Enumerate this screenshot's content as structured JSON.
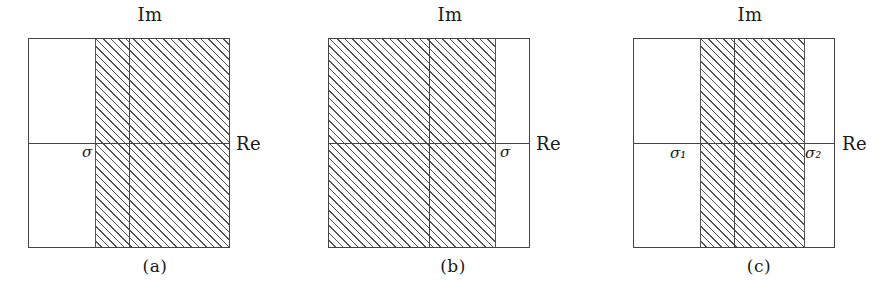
{
  "figure": {
    "kind": "complex-plane-region-of-convergence-diagrams",
    "panels": [
      {
        "id": "a",
        "caption": "(a)",
        "imaginary_axis_label": "Im",
        "real_axis_label": "Re",
        "abscissa_labels": [
          "σ"
        ],
        "shaded_description": "right half plane Re{s} > sigma",
        "hatch_regions": [
          {
            "left_pct": 33,
            "right_pct": 100
          }
        ],
        "vertical_rules_pct": [
          33,
          50
        ],
        "horizontal_rule_pct": 50,
        "sigma_marks": [
          {
            "label": "σ",
            "subscript": "",
            "x_pct": 33,
            "side": "left"
          }
        ]
      },
      {
        "id": "b",
        "caption": "(b)",
        "imaginary_axis_label": "Im",
        "real_axis_label": "Re",
        "abscissa_labels": [
          "σ"
        ],
        "shaded_description": "left half plane Re{s} < sigma",
        "hatch_regions": [
          {
            "left_pct": 0,
            "right_pct": 83
          }
        ],
        "vertical_rules_pct": [
          50,
          83
        ],
        "horizontal_rule_pct": 50,
        "sigma_marks": [
          {
            "label": "σ",
            "subscript": "",
            "x_pct": 83,
            "side": "right"
          }
        ]
      },
      {
        "id": "c",
        "caption": "(c)",
        "imaginary_axis_label": "Im",
        "real_axis_label": "Re",
        "abscissa_labels": [
          "σ₁",
          "σ₂"
        ],
        "shaded_description": "vertical strip sigma1 < Re{s} < sigma2",
        "hatch_regions": [
          {
            "left_pct": 33,
            "right_pct": 85
          }
        ],
        "vertical_rules_pct": [
          33,
          50,
          85
        ],
        "horizontal_rule_pct": 50,
        "sigma_marks": [
          {
            "label": "σ",
            "subscript": "1",
            "x_pct": 33,
            "side": "left"
          },
          {
            "label": "σ",
            "subscript": "2",
            "x_pct": 85,
            "side": "right"
          }
        ]
      }
    ],
    "colors": {
      "background": "#ffffff",
      "stroke": "#444444",
      "hatch": "#555555",
      "text": "#1a1a1a"
    }
  }
}
